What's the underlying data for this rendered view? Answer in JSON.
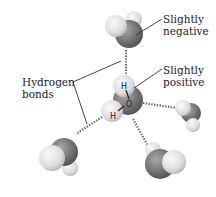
{
  "diagram": {
    "labels": {
      "slightly_negative_line1": "Slightly",
      "slightly_negative_line2": "negative",
      "slightly_positive_line1": "Slightly",
      "slightly_positive_line2": "positive",
      "hydrogen_bonds_line1": "Hydrogen",
      "hydrogen_bonds_line2": "bonds"
    },
    "central_molecule": {
      "hydrogen_top": "H",
      "oxygen": "O",
      "hydrogen_bottom": "H"
    },
    "colors": {
      "oxygen": "#6e6e6e",
      "hydrogen": "#e6e6e6",
      "hbond": "#6a6a6a",
      "text": "#222222"
    }
  }
}
